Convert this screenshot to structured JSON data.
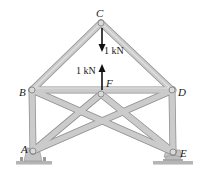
{
  "diagram": {
    "type": "truss",
    "colors": {
      "member_fill": "#c9c9c9",
      "member_edge": "#8f8f8f",
      "pin": "#d8d8d8",
      "arrow": "#111111",
      "ground": "#b5b5b5"
    },
    "joints": {
      "A": {
        "label": "A",
        "x": 33,
        "y": 151
      },
      "B": {
        "label": "B",
        "x": 32,
        "y": 90
      },
      "C": {
        "label": "C",
        "x": 101,
        "y": 23
      },
      "D": {
        "label": "D",
        "x": 172,
        "y": 90
      },
      "E": {
        "label": "E",
        "x": 173,
        "y": 152
      },
      "F": {
        "label": "F",
        "x": 101,
        "y": 94
      }
    },
    "members": [
      "AB",
      "BC",
      "CD",
      "DE",
      "BD",
      "AF",
      "FE",
      "BE",
      "DA"
    ],
    "loads": [
      {
        "joint": "C",
        "label": "1 kN",
        "direction": "down"
      },
      {
        "joint": "F",
        "label": "1 kN",
        "direction": "up"
      }
    ],
    "supports": [
      {
        "joint": "A",
        "type": "pin"
      },
      {
        "joint": "E",
        "type": "rocker"
      }
    ]
  }
}
